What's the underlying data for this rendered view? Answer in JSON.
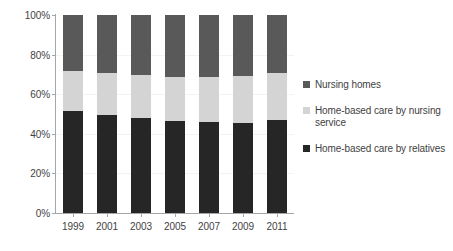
{
  "chart_data": {
    "type": "bar",
    "subtype": "stacked-percentage",
    "title": "",
    "subtitle": "",
    "xlabel": "",
    "ylabel": "",
    "categories": [
      "1999",
      "2001",
      "2003",
      "2005",
      "2007",
      "2009",
      "2011"
    ],
    "series": [
      {
        "name": "Home-based care by relatives",
        "color": "#262626",
        "values": [
          51.3,
          49.4,
          47.9,
          46.3,
          46.2,
          45.4,
          47.0
        ]
      },
      {
        "name": "Home-based care by nursing service",
        "color": "#d4d4d4",
        "values": [
          20.6,
          21.4,
          21.7,
          22.6,
          22.7,
          23.6,
          23.6
        ]
      },
      {
        "name": "Nursing homes",
        "color": "#595959",
        "values": [
          28.1,
          29.2,
          30.4,
          31.1,
          31.1,
          31.0,
          29.4
        ]
      }
    ],
    "legend": {
      "position": "right",
      "entries": [
        {
          "label": "Nursing homes",
          "color": "#595959"
        },
        {
          "label": "Home-based care by nursing service",
          "color": "#d4d4d4"
        },
        {
          "label": "Home-based care by relatives",
          "color": "#262626"
        }
      ]
    },
    "yaxis": {
      "ticks": [
        "0%",
        "20%",
        "40%",
        "60%",
        "80%",
        "100%"
      ],
      "tick_values": [
        0,
        20,
        40,
        60,
        80,
        100
      ],
      "ylim": [
        0,
        100
      ],
      "grid": false
    },
    "xaxis": {
      "ticks": [
        "1999",
        "2001",
        "2003",
        "2005",
        "2007",
        "2009",
        "2011"
      ],
      "grid": false
    }
  }
}
